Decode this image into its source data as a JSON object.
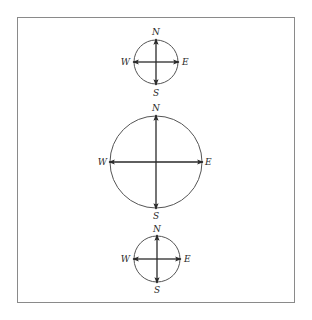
{
  "diagram": {
    "type": "compass-rose-set",
    "frame": {
      "stroke": "#8a8a8a"
    },
    "colors": {
      "circle": "#555555",
      "arrow": "#2a2a2a",
      "label": "#2a2a2a"
    },
    "compasses": [
      {
        "id": "top",
        "cx": 156,
        "cy": 62,
        "r": 22,
        "labels": {
          "n": "N",
          "s": "S",
          "e": "E",
          "w": "W"
        }
      },
      {
        "id": "middle",
        "cx": 156,
        "cy": 162,
        "r": 46,
        "labels": {
          "n": "N",
          "s": "S",
          "e": "E",
          "w": "W"
        }
      },
      {
        "id": "bottom",
        "cx": 157,
        "cy": 259,
        "r": 23,
        "labels": {
          "n": "N",
          "s": "S",
          "e": "E",
          "w": "W"
        }
      }
    ]
  }
}
